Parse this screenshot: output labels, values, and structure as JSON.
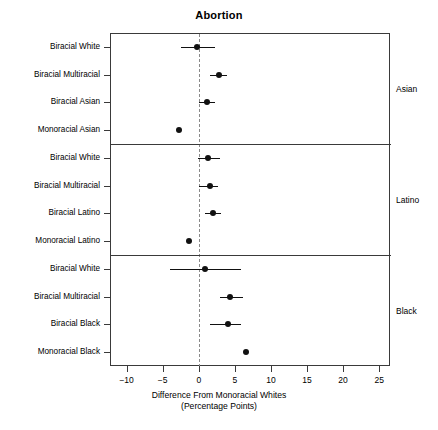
{
  "chart_data": {
    "type": "scatter",
    "title": "Abortion",
    "xlabel": "Difference From Monoracial Whites",
    "xlabel_line2": "(Percentage Points)",
    "ylabel": "",
    "xlim": [
      -12.3,
      26.5
    ],
    "xticks": [
      -10,
      -5,
      0,
      5,
      10,
      15,
      20,
      25
    ],
    "xticklabels": [
      "−10",
      "−5",
      "0",
      "5",
      "10",
      "15",
      "20",
      "25"
    ],
    "grid": false,
    "legend": null,
    "reference_line": 0,
    "reference_line_style": "dashed",
    "panels": [
      {
        "label": "Asian",
        "points": [
          {
            "category": "Biracial White",
            "value": -0.3,
            "ci_low": -2.4,
            "ci_high": 2.3,
            "has_ci": true
          },
          {
            "category": "Biracial Multiracial",
            "value": 2.8,
            "ci_low": 1.6,
            "ci_high": 3.9,
            "has_ci": true
          },
          {
            "category": "Biracial Asian",
            "value": 1.1,
            "ci_low": 0.0,
            "ci_high": 2.3,
            "has_ci": true
          },
          {
            "category": "Monoracial Asian",
            "value": -2.8,
            "ci_low": -2.8,
            "ci_high": -2.8,
            "has_ci": false
          }
        ]
      },
      {
        "label": "Latino",
        "points": [
          {
            "category": "Biracial White",
            "value": 1.3,
            "ci_low": -0.1,
            "ci_high": 2.9,
            "has_ci": true
          },
          {
            "category": "Biracial Multiracial",
            "value": 1.5,
            "ci_low": 0.1,
            "ci_high": 2.7,
            "has_ci": true
          },
          {
            "category": "Biracial Latino",
            "value": 2.0,
            "ci_low": 0.9,
            "ci_high": 3.1,
            "has_ci": true
          },
          {
            "category": "Monoracial Latino",
            "value": -1.4,
            "ci_low": -1.4,
            "ci_high": -1.4,
            "has_ci": false
          }
        ]
      },
      {
        "label": "Black",
        "points": [
          {
            "category": "Biracial White",
            "value": 0.8,
            "ci_low": -4.0,
            "ci_high": 5.8,
            "has_ci": true
          },
          {
            "category": "Biracial Multiracial",
            "value": 4.3,
            "ci_low": 3.0,
            "ci_high": 6.2,
            "has_ci": true
          },
          {
            "category": "Biracial Black",
            "value": 4.0,
            "ci_low": 1.6,
            "ci_high": 5.9,
            "has_ci": true
          },
          {
            "category": "Monoracial Black",
            "value": 6.5,
            "ci_low": 6.5,
            "ci_high": 6.5,
            "has_ci": false
          }
        ]
      }
    ]
  },
  "colors": {
    "point": "#111111",
    "axis": "#3a3a3a",
    "reference": "#8a8a8a",
    "background": "#ffffff"
  }
}
